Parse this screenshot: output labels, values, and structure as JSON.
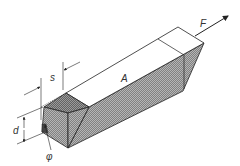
{
  "diagram": {
    "type": "technical-drawing",
    "labels": {
      "force": "F",
      "area": "A",
      "width": "s",
      "depth": "d",
      "angle": "φ"
    },
    "colors": {
      "line": "#222222",
      "hatch": "#8a8a8a",
      "hatch_dark": "#6e6e6e",
      "face_light": "#ffffff",
      "background": "#ffffff"
    }
  }
}
